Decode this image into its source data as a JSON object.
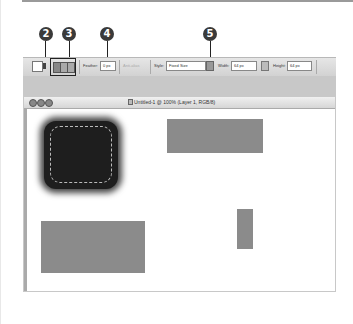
{
  "callouts": [
    {
      "number": "2",
      "target": "tool-preset"
    },
    {
      "number": "3",
      "target": "selection-mode-buttons"
    },
    {
      "number": "4",
      "target": "feather-field"
    },
    {
      "number": "5",
      "target": "style-dropdown"
    }
  ],
  "options_bar": {
    "feather_label": "Feather:",
    "feather_value": "0 px",
    "antialias_label": "Anti-alias",
    "style_label": "Style:",
    "style_value": "Fixed Size",
    "width_label": "Width:",
    "width_value": "64 px",
    "height_label": "Height:",
    "height_value": "64 px"
  },
  "document_window": {
    "title": "Untitled-1 @ 100% (Layer 1, RGB/8)",
    "window_buttons": [
      "close",
      "minimize",
      "zoom"
    ]
  },
  "canvas": {
    "shapes": [
      {
        "type": "blurred-rounded-square",
        "color": "#1e1e1e",
        "selected": true
      },
      {
        "type": "rectangle",
        "color": "#8b8b8b"
      },
      {
        "type": "rectangle",
        "color": "#8b8b8b"
      },
      {
        "type": "rectangle",
        "color": "#8b8b8b"
      }
    ]
  }
}
